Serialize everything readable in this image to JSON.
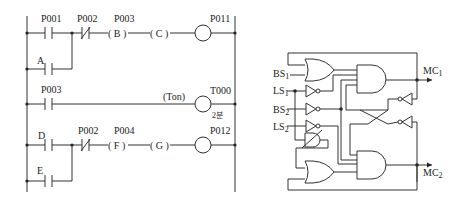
{
  "ladder": {
    "rungs": [
      {
        "contacts": [
          {
            "label": "P001",
            "type": "NO"
          },
          {
            "label": "P002",
            "type": "NC"
          },
          {
            "label": "P003",
            "type": "slot",
            "text": "( B )"
          },
          {
            "label": "",
            "type": "slot",
            "text": "( C )"
          }
        ],
        "parallel": {
          "label": "A",
          "type": "NO"
        },
        "coil": "P011"
      },
      {
        "contacts": [
          {
            "label": "P003",
            "type": "NO"
          }
        ],
        "timer_label": "(Ton)",
        "coil": "T000",
        "preset": "2분"
      },
      {
        "contacts": [
          {
            "label": "D",
            "type": "NO"
          },
          {
            "label": "P002",
            "type": "NC"
          },
          {
            "label": "P004",
            "type": "slot",
            "text": "( F )"
          },
          {
            "label": "",
            "type": "slot",
            "text": "( G )"
          }
        ],
        "parallel": {
          "label": "E",
          "type": "NO"
        },
        "coil": "P012"
      }
    ],
    "text": {
      "r1_c1": "P001",
      "r1_c2": "P002",
      "r1_c3": "P003",
      "r1_B": "( B )",
      "r1_C": "( C )",
      "r1_coil": "P011",
      "r1_par": "A",
      "r2_c1": "P003",
      "r2_ton": "(Ton)",
      "r2_coil": "T000",
      "r2_preset": "2분",
      "r3_c1": "D",
      "r3_c2": "P002",
      "r3_c3": "P004",
      "r3_F": "( F )",
      "r3_G": "( G )",
      "r3_coil": "P012",
      "r3_par": "E"
    }
  },
  "logic": {
    "inputs": [
      "BS",
      "LS",
      "BS",
      "LS"
    ],
    "input_subs": [
      "1",
      "1",
      "2",
      "2"
    ],
    "outputs": [
      "MC",
      "MC"
    ],
    "output_subs": [
      "1",
      "2"
    ]
  }
}
